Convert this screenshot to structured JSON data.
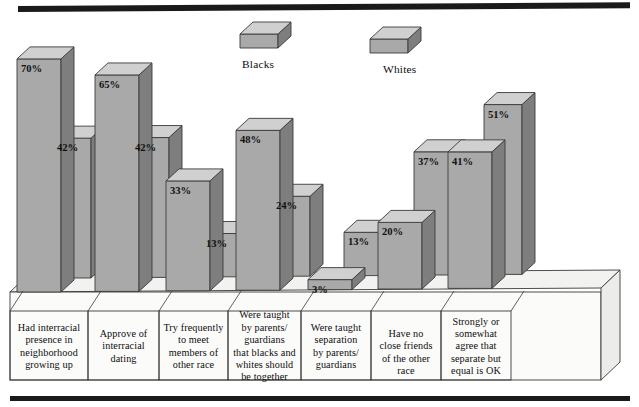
{
  "figure": {
    "top_rule": "thick-black-rule",
    "bottom_rule": "thick-black-rule"
  },
  "legend": {
    "position": "top-center",
    "items": [
      {
        "key": "blacks",
        "label": "Blacks",
        "swatch": "3d-cube"
      },
      {
        "key": "whites",
        "label": "Whites",
        "swatch": "3d-cube"
      }
    ]
  },
  "colors": {
    "bar_front": "#a9a9a9",
    "bar_top": "#d0d0d0",
    "bar_side": "#7e7e7e",
    "base_top": "#f2f2f0",
    "base_front": "#fbfbfa",
    "base_side": "#ececea",
    "outline": "#3a3a3a",
    "rule": "#1a1a1a",
    "text": "#0d0d0d"
  },
  "chart_data": {
    "type": "bar",
    "title": "",
    "subtitle": "",
    "xlabel": "",
    "ylabel": "",
    "ylim": [
      0,
      75
    ],
    "grid": false,
    "legend_position": "top-center",
    "style": "3d-grouped-column",
    "value_suffix": "%",
    "categories": [
      "Had interracial presence in neighborhood growing up",
      "Approve of interracial dating",
      "Try frequently to meet members of other race",
      "Were taught by parents/ guardians that blacks and whites should be together",
      "Were taught separation by parents/ guardians",
      "Have no close friends of the other race",
      "Strongly or somewhat agree that separate but equal is OK"
    ],
    "series": [
      {
        "name": "Blacks",
        "values": [
          70,
          65,
          33,
          48,
          3,
          20,
          41
        ]
      },
      {
        "name": "Whites",
        "values": [
          42,
          42,
          13,
          24,
          13,
          37,
          51
        ]
      }
    ]
  },
  "category_labels": [
    {
      "lines": [
        "Had interracial",
        "presence in",
        "neighborhood",
        "growing up"
      ]
    },
    {
      "lines": [
        "Approve of",
        "interracial",
        "dating"
      ]
    },
    {
      "lines": [
        "Try frequently",
        "to meet",
        "members of",
        "other race"
      ]
    },
    {
      "lines": [
        "Were taught",
        "by parents/",
        "guardians",
        "that blacks and",
        "whites should",
        "be together"
      ]
    },
    {
      "lines": [
        "Were taught",
        "separation",
        "by parents/",
        "guardians"
      ]
    },
    {
      "lines": [
        "Have no",
        "close friends",
        "of the other race"
      ]
    },
    {
      "lines": [
        "Strongly or",
        "somewhat",
        "agree that",
        "separate but",
        "equal is OK"
      ]
    }
  ],
  "value_labels": [
    {
      "group": 0,
      "series": "Blacks",
      "text": "70%"
    },
    {
      "group": 0,
      "series": "Whites",
      "text": "42%"
    },
    {
      "group": 1,
      "series": "Blacks",
      "text": "65%"
    },
    {
      "group": 1,
      "series": "Whites",
      "text": "42%"
    },
    {
      "group": 2,
      "series": "Blacks",
      "text": "33%"
    },
    {
      "group": 2,
      "series": "Whites",
      "text": "13%"
    },
    {
      "group": 3,
      "series": "Blacks",
      "text": "48%"
    },
    {
      "group": 3,
      "series": "Whites",
      "text": "24%"
    },
    {
      "group": 4,
      "series": "Blacks",
      "text": "3%"
    },
    {
      "group": 4,
      "series": "Whites",
      "text": "13%"
    },
    {
      "group": 5,
      "series": "Blacks",
      "text": "20%"
    },
    {
      "group": 5,
      "series": "Whites",
      "text": "37%"
    },
    {
      "group": 6,
      "series": "Blacks",
      "text": "41%"
    },
    {
      "group": 6,
      "series": "Whites",
      "text": "51%"
    }
  ]
}
